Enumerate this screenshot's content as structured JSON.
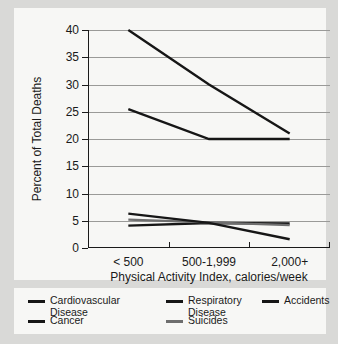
{
  "colors": {
    "background": "#d9d9d7",
    "panel": "#f7f7f5",
    "axis": "#1a1a1a",
    "gridline": "#9a9a98",
    "series_dark": "#161616",
    "series_gray": "#6e6e6e"
  },
  "chart_data": {
    "type": "line",
    "title": "",
    "xlabel": "Physical Activity Index, calories/week",
    "ylabel": "Percent of Total Deaths",
    "categories": [
      "< 500",
      "500-1,999",
      "2,000+"
    ],
    "ylim": [
      0,
      40
    ],
    "yticks": [
      0,
      5,
      10,
      15,
      20,
      25,
      30,
      35,
      40
    ],
    "ytick_labels": [
      "0",
      "5",
      "10",
      "15",
      "20",
      "25",
      "30",
      "35",
      "40"
    ],
    "grid": true,
    "legend_position": "bottom",
    "series": [
      {
        "name": "Cardiovascular Disease",
        "values": [
          40.0,
          30.0,
          21.0
        ],
        "color": "#161616"
      },
      {
        "name": "Cancer",
        "values": [
          25.5,
          20.0,
          20.0
        ],
        "color": "#161616"
      },
      {
        "name": "Respiratory Disease",
        "values": [
          4.1,
          4.6,
          4.5
        ],
        "color": "#161616"
      },
      {
        "name": "Suicides",
        "values": [
          5.2,
          4.7,
          4.2
        ],
        "color": "#6e6e6e"
      },
      {
        "name": "Accidents",
        "values": [
          6.3,
          4.6,
          1.6
        ],
        "color": "#161616"
      }
    ]
  },
  "legend": {
    "entries": [
      {
        "label": "Cardiovascular\nDisease",
        "color": "#161616"
      },
      {
        "label": "Respiratory\nDisease",
        "color": "#161616"
      },
      {
        "label": "Accidents",
        "color": "#161616"
      },
      {
        "label": "Cancer",
        "color": "#161616"
      },
      {
        "label": "Suicides",
        "color": "#6e6e6e"
      }
    ]
  }
}
